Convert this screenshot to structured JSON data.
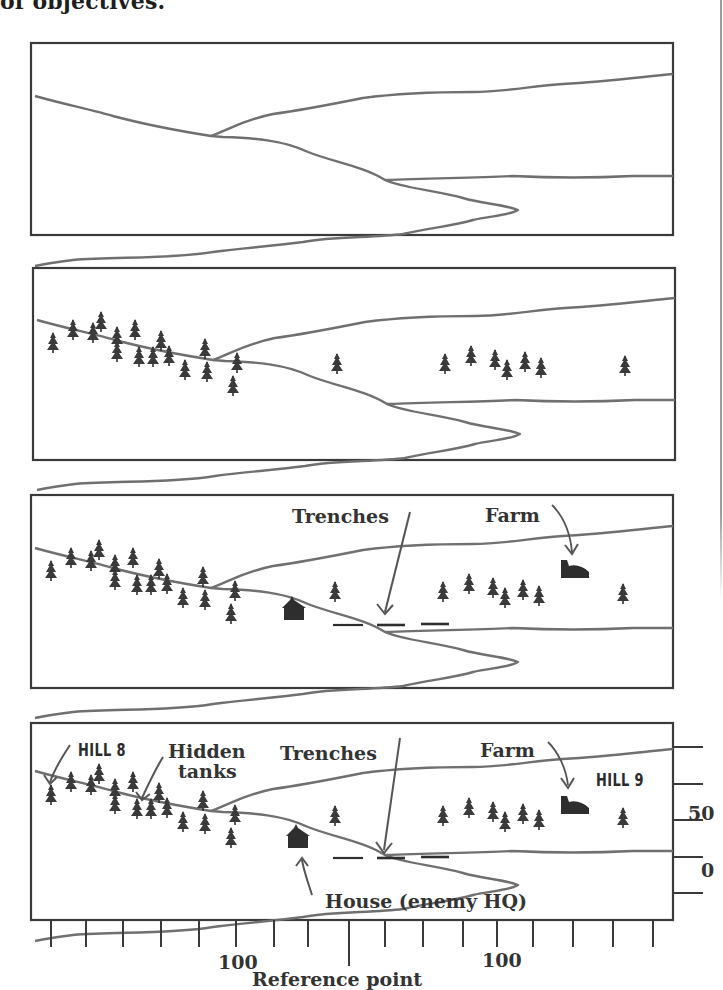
{
  "heading": "of objectives.",
  "colors": {
    "ink": "#2b2b2b",
    "terrain_line": "#6f6f6f",
    "frame": "#3a3a3a",
    "paper": "#ffffff"
  },
  "panels": [
    {
      "id": "panel-1",
      "description": "Terrain outline only",
      "labels": []
    },
    {
      "id": "panel-2",
      "description": "Terrain with trees added",
      "labels": []
    },
    {
      "id": "panel-3",
      "description": "Terrain with trees, house, trenches and farm",
      "labels": [
        {
          "key": "trenches",
          "text": "Trenches"
        },
        {
          "key": "farm",
          "text": "Farm"
        }
      ]
    },
    {
      "id": "panel-4",
      "description": "Complete range card with labels and reference scale",
      "labels": [
        {
          "key": "hill8",
          "text": "HILL 8"
        },
        {
          "key": "hidden_tanks_1",
          "text": "Hidden"
        },
        {
          "key": "hidden_tanks_2",
          "text": "tanks"
        },
        {
          "key": "trenches",
          "text": "Trenches"
        },
        {
          "key": "farm",
          "text": "Farm"
        },
        {
          "key": "hill9",
          "text": "HILL 9"
        },
        {
          "key": "house",
          "text": "House (enemy HQ)"
        }
      ]
    }
  ],
  "scale": {
    "right_axis_labels": [
      "50",
      "0"
    ],
    "bottom_axis_labels": [
      "100",
      "100"
    ],
    "bottom_axis_title": "Reference point",
    "bottom_tick_count": 17,
    "right_tick_count": 5
  }
}
